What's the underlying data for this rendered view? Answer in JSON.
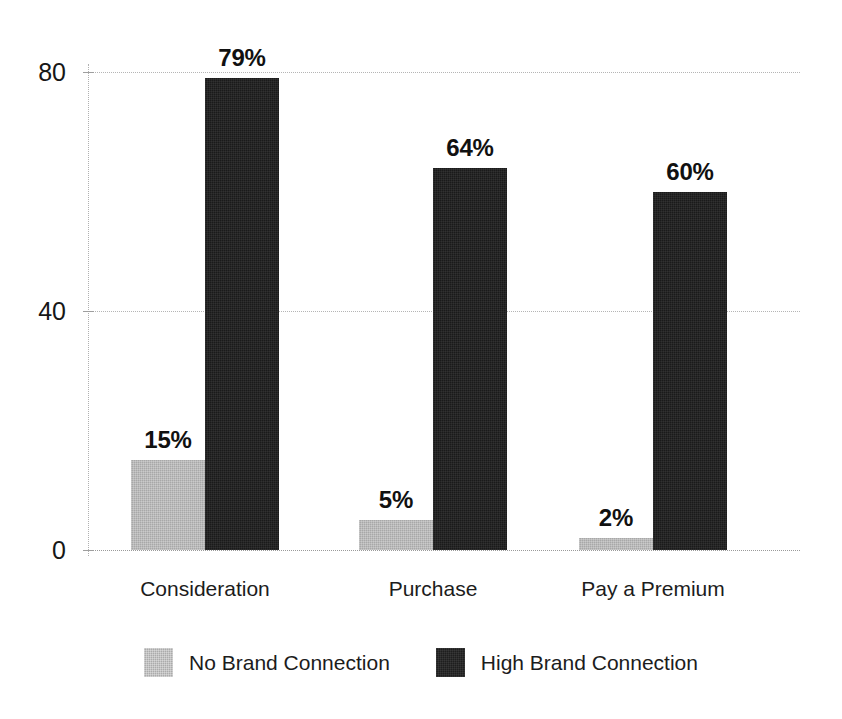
{
  "chart_data": {
    "type": "bar",
    "title": "",
    "subtitle": "",
    "xlabel": "",
    "ylabel": "",
    "ylim": [
      0,
      80
    ],
    "yticks": [
      "0",
      "40",
      "80"
    ],
    "ytick_values": [
      0,
      40,
      80
    ],
    "grid": true,
    "legend_position": "bottom",
    "grouped": true,
    "categories": [
      "Consideration",
      "Purchase",
      "Pay a Premium"
    ],
    "series": [
      {
        "name": "No Brand Connection",
        "color": "#a8a8a8",
        "values": [
          15,
          5,
          2
        ],
        "labels": [
          "15%",
          "5%",
          "2%"
        ]
      },
      {
        "name": "High Brand Connection",
        "color": "#1a1a1a",
        "values": [
          79,
          64,
          60
        ],
        "labels": [
          "79%",
          "64%",
          "60%"
        ]
      }
    ]
  },
  "legend": {
    "items": [
      {
        "label": "No Brand Connection",
        "swatch": "series-light"
      },
      {
        "label": "High Brand Connection",
        "swatch": "series-dark"
      }
    ]
  },
  "axes": {
    "y": {
      "ticks": [
        {
          "label": "80",
          "value": 80
        },
        {
          "label": "40",
          "value": 40
        },
        {
          "label": "0",
          "value": 0
        }
      ]
    },
    "x": {
      "ticks": [
        {
          "label": "Consideration"
        },
        {
          "label": "Purchase"
        },
        {
          "label": "Pay a Premium"
        }
      ]
    }
  }
}
